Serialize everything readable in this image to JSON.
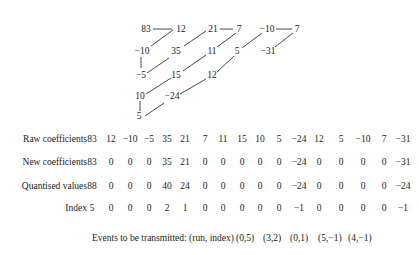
{
  "zigzag": {
    "nodes": [
      {
        "v": "83",
        "x": 146,
        "y": 29
      },
      {
        "v": "12",
        "x": 181,
        "y": 29
      },
      {
        "v": "21",
        "x": 213,
        "y": 29
      },
      {
        "v": "7",
        "x": 239,
        "y": 29
      },
      {
        "v": "−10",
        "x": 267,
        "y": 29
      },
      {
        "v": "7",
        "x": 297,
        "y": 29
      },
      {
        "v": "−10",
        "x": 142,
        "y": 51
      },
      {
        "v": "35",
        "x": 176,
        "y": 51
      },
      {
        "v": "11",
        "x": 212,
        "y": 51
      },
      {
        "v": "5",
        "x": 237,
        "y": 51
      },
      {
        "v": "−31",
        "x": 268,
        "y": 51
      },
      {
        "v": "−5",
        "x": 141,
        "y": 75
      },
      {
        "v": "15",
        "x": 176,
        "y": 75
      },
      {
        "v": "12",
        "x": 212,
        "y": 75
      },
      {
        "v": "10",
        "x": 140,
        "y": 96
      },
      {
        "v": "−24",
        "x": 172,
        "y": 96
      },
      {
        "v": "5",
        "x": 139,
        "y": 116
      }
    ]
  },
  "table": {
    "rows": [
      {
        "label": "Raw coefficients",
        "values": [
          "83",
          "12",
          "−10",
          "−5",
          "35",
          "21",
          "7",
          "11",
          "15",
          "10",
          "5",
          "−24",
          "12",
          "5",
          "−10",
          "7",
          "−31"
        ]
      },
      {
        "label": "New coefficients",
        "values": [
          "83",
          "0",
          "0",
          "0",
          "35",
          "21",
          "0",
          "0",
          "0",
          "0",
          "0",
          "−24",
          "0",
          "0",
          "0",
          "0",
          "−31"
        ]
      },
      {
        "label": "Quantised values",
        "values": [
          "88",
          "0",
          "0",
          "0",
          "40",
          "24",
          "0",
          "0",
          "0",
          "0",
          "0",
          "−24",
          "0",
          "0",
          "0",
          "0",
          "−24"
        ]
      },
      {
        "label": "Index",
        "values": [
          "5",
          "0",
          "0",
          "0",
          "2",
          "1",
          "0",
          "0",
          "0",
          "0",
          "0",
          "−1",
          "0",
          "0",
          "0",
          "0",
          "−1"
        ]
      }
    ]
  },
  "events": {
    "label": "Events to be transmitted: (run, index)",
    "items": [
      "(0,5)",
      "(3,2)",
      "(0,1)",
      "(5,−1)",
      "(4,−1)"
    ]
  }
}
